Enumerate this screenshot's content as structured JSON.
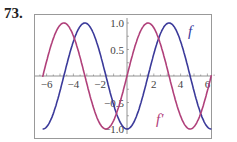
{
  "problem_number": "73.",
  "chart_data": {
    "type": "line",
    "title": "",
    "xlabel": "",
    "ylabel": "",
    "xlim": [
      -6.5,
      6.5
    ],
    "ylim": [
      -1,
      1
    ],
    "x_ticks": [
      "-6",
      "-4",
      "-2",
      "2",
      "4",
      "6"
    ],
    "y_ticks": [
      "1.0",
      "0.5",
      "-0.5",
      "-1.0"
    ],
    "grid": false,
    "series": [
      {
        "name": "f",
        "formula": "-cos(x)",
        "color": "#3b3a9a",
        "x": [
          -6.28,
          -4.71,
          -3.14,
          -1.57,
          0,
          1.57,
          3.14,
          4.71,
          6.28
        ],
        "values": [
          -1,
          0,
          1,
          0,
          -1,
          0,
          1,
          0,
          -1
        ]
      },
      {
        "name": "f'",
        "formula": "sin(x)",
        "color": "#b0407a",
        "x": [
          -6.28,
          -4.71,
          -3.14,
          -1.57,
          0,
          1.57,
          3.14,
          4.71,
          6.28
        ],
        "values": [
          0,
          1,
          0,
          -1,
          0,
          1,
          0,
          -1,
          0
        ]
      }
    ],
    "annotations": [
      {
        "text": "f",
        "near": "blue curve top-right"
      },
      {
        "text": "f'",
        "near": "magenta curve bottom-right"
      }
    ]
  }
}
